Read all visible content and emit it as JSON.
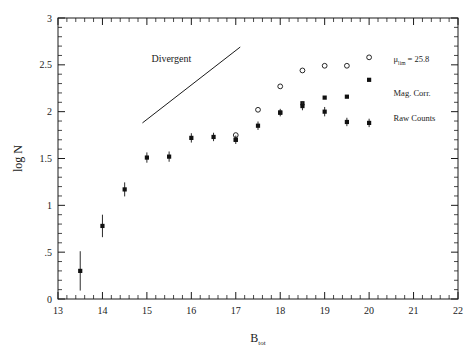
{
  "chart_data": {
    "type": "scatter",
    "title": "",
    "xlabel": "B",
    "xlabel_sub": "tot",
    "ylabel": "log N",
    "xlim": [
      13,
      22
    ],
    "ylim": [
      0,
      3
    ],
    "grid": false,
    "x_ticks": [
      "13",
      "14",
      "15",
      "16",
      "17",
      "18",
      "19",
      "20",
      "21",
      "22"
    ],
    "x_tick_values": [
      13,
      14,
      15,
      16,
      17,
      18,
      19,
      20,
      21,
      22
    ],
    "x_minor_step": 0.2,
    "y_ticks": [
      "0",
      ".5",
      "1",
      "1.5",
      "2",
      "2.5",
      "3"
    ],
    "y_tick_values": [
      0,
      0.5,
      1,
      1.5,
      2,
      2.5,
      3
    ],
    "y_minor_step": 0.1,
    "legend_position": "inside-right",
    "annotations": [
      {
        "name": "divergent-annotation",
        "text": "Divergent",
        "x": 15.55,
        "y": 2.53
      }
    ],
    "reference_lines": [
      {
        "name": "divergent-slope-line",
        "x0": 14.9,
        "y0": 1.88,
        "x1": 17.1,
        "y1": 2.69
      }
    ],
    "series": [
      {
        "name": "mu-lim-series",
        "label": "μ",
        "label_sub": "lim",
        "label_suffix": " = 25.8",
        "label_x": 20.55,
        "label_y": 2.53,
        "marker": "open-circle",
        "x": [
          17.0,
          17.5,
          18.0,
          18.5,
          19.0,
          19.5,
          20.0
        ],
        "values": [
          1.75,
          2.02,
          2.27,
          2.44,
          2.49,
          2.49,
          2.58
        ],
        "yerr": [
          0,
          0,
          0,
          0,
          0,
          0,
          0
        ]
      },
      {
        "name": "mag-corr-series",
        "label": "Mag. Corr.",
        "label_sub": "",
        "label_suffix": "",
        "label_x": 20.55,
        "label_y": 2.17,
        "marker": "filled-square",
        "x": [
          17.0,
          18.0,
          18.5,
          19.0,
          19.5,
          20.0
        ],
        "values": [
          1.7,
          1.99,
          2.09,
          2.15,
          2.16,
          2.34
        ],
        "yerr": [
          0,
          0,
          0,
          0,
          0,
          0
        ]
      },
      {
        "name": "raw-counts-series",
        "label": "Raw Counts",
        "label_sub": "",
        "label_suffix": "",
        "label_x": 20.55,
        "label_y": 1.9,
        "marker": "filled-circle-errorbar",
        "x": [
          13.5,
          14.0,
          14.5,
          15.0,
          15.5,
          16.0,
          16.5,
          17.0,
          17.5,
          18.0,
          18.5,
          19.0,
          19.5,
          20.0
        ],
        "values": [
          0.3,
          0.78,
          1.17,
          1.51,
          1.52,
          1.72,
          1.73,
          1.7,
          1.85,
          1.99,
          2.06,
          2.0,
          1.89,
          1.88
        ],
        "yerr": [
          0.21,
          0.12,
          0.075,
          0.055,
          0.055,
          0.05,
          0.045,
          0.045,
          0.045,
          0.04,
          0.045,
          0.05,
          0.045,
          0.045
        ]
      }
    ]
  },
  "colors": {
    "axis": "#1a1a1a",
    "marker": "#111111",
    "background": "#ffffff"
  }
}
